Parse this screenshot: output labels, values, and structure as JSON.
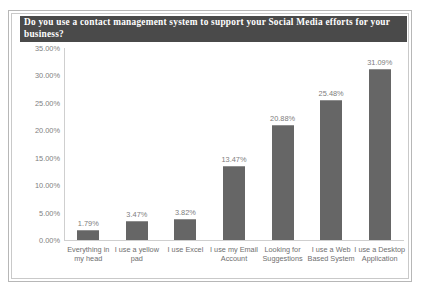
{
  "chart_data": {
    "type": "bar",
    "title": "Do you use a contact management system to support your Social Media efforts for your business?",
    "xlabel": "",
    "ylabel": "",
    "ylim": [
      0,
      35
    ],
    "grid": false,
    "legend": false,
    "categories": [
      "Everything in my head",
      "I use a yellow pad",
      "I use Excel",
      "I use my Email Account",
      "Looking for Suggestions",
      "I use a Web Based System",
      "I use a Desktop Application"
    ],
    "values": [
      1.79,
      3.47,
      3.82,
      13.47,
      20.88,
      25.48,
      31.09
    ],
    "data_labels": [
      "1.79%",
      "3.47%",
      "3.82%",
      "13.47%",
      "20.88%",
      "25.48%",
      "31.09%"
    ],
    "ytick_labels": [
      "0.00%",
      "5.00%",
      "10.00%",
      "15.00%",
      "20.00%",
      "25.00%",
      "30.00%",
      "35.00%"
    ],
    "ytick_values": [
      0,
      5,
      10,
      15,
      20,
      25,
      30,
      35
    ],
    "colors": {
      "bar": "#666666",
      "bar_top": "#8e8e8e",
      "title_bar_bg": "#4a4a4a",
      "title_text": "#ffffff",
      "axis": "#cfcfcf",
      "tick_text": "#808080",
      "frame": "#b7b7b7",
      "background": "#ffffff"
    }
  }
}
